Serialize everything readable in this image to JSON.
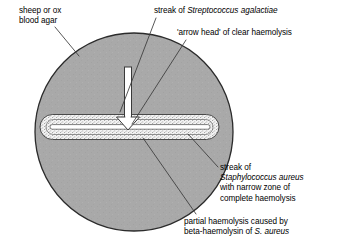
{
  "figure": {
    "colors": {
      "background": "#ffffff",
      "agar_fill": "#a9a9a9",
      "agar_outline": "#2b2b2b",
      "haemolysis_band": "#f2f2f2",
      "stipple_dot": "#555555",
      "streak_white": "#ffffff",
      "leader_line": "#3a3a3a",
      "text": "#000000"
    }
  },
  "labels": {
    "agar": {
      "name": "sheep-or-ox-blood-agar",
      "line1": "sheep or ox",
      "line2": "blood agar"
    },
    "streptococcus_streak": {
      "name": "streak-of-streptococcus-agalactiae",
      "prefix": "streak of ",
      "species": "Streptococcus agalactiae"
    },
    "arrow_head": {
      "name": "arrow-head-of-clear-haemolysis",
      "line1": "'arrow head' of clear haemolysis"
    },
    "staphylococcus_streak": {
      "name": "streak-of-staphylococcus-aureus",
      "line1": "streak of",
      "species": "Staphylococcus aureus",
      "line3": "with narrow zone of",
      "line4": "complete haemolysis"
    },
    "partial_haemolysis": {
      "name": "partial-haemolysis-beta-haemolysin",
      "line1": "partial haemolysis caused by",
      "line2_prefix": "beta-haemolysin of ",
      "line2_species": "S. aureus"
    }
  },
  "diagram_parts": {
    "petri_dish": "agar-plate-circle",
    "staph_streak": "horizontal-staphylococcus-streak",
    "partial_zone": "stippled-partial-haemolysis-band",
    "strep_arrow": "vertical-white-arrow-streptococcus-streak",
    "arrow_tip": "clear-haemolysis-arrow-head"
  },
  "geometry": {
    "circle_cx": 134,
    "circle_cy": 132,
    "circle_r": 99,
    "streak_left": 40,
    "streak_right": 219,
    "streak_cy": 127,
    "arrow_x": 128,
    "arrow_top": 67,
    "arrow_tip_y": 128
  }
}
